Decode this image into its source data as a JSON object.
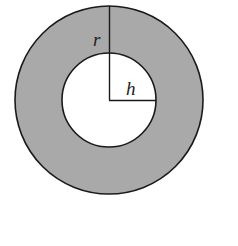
{
  "diagram": {
    "type": "annulus",
    "center": [
      109,
      100
    ],
    "outer_radius": 94,
    "inner_radius": 47,
    "fill_color": "#a9a9a9",
    "stroke_color": "#1a1a1a",
    "labels": {
      "outer_radius": "r",
      "inner_radius": "h"
    }
  }
}
